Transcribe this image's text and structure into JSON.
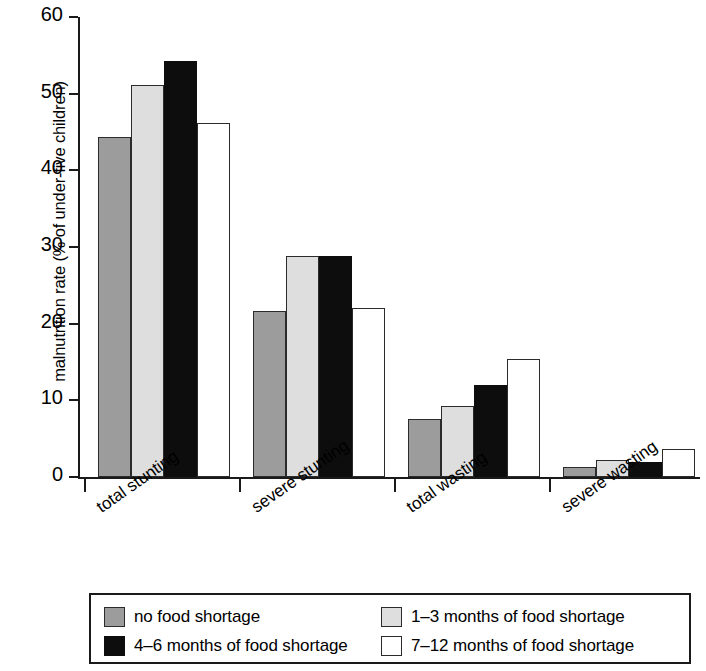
{
  "chart_data": {
    "type": "bar",
    "title": "",
    "xlabel": "",
    "ylabel": "malnutrition rate (% of under-five children)",
    "ylim": [
      0,
      60
    ],
    "yticks": [
      0,
      10,
      20,
      30,
      40,
      50,
      60
    ],
    "ytick_labels": [
      "0",
      "10",
      "20",
      "30",
      "40",
      "50",
      "60"
    ],
    "grid": false,
    "legend_position": "bottom",
    "categories": [
      "total stunting",
      "severe stunting",
      "total wasting",
      "severe wasting"
    ],
    "series": [
      {
        "name": "no food shortage",
        "color": "#9c9c9c",
        "values": [
          44.4,
          21.7,
          7.6,
          1.3
        ]
      },
      {
        "name": "1–3 months of food shortage",
        "color": "#dedede",
        "values": [
          51.1,
          28.8,
          9.3,
          2.2
        ]
      },
      {
        "name": "4–6 months of food shortage",
        "color": "#0d0d0d",
        "values": [
          54.3,
          28.8,
          12.0,
          1.9
        ]
      },
      {
        "name": "7–12 months of food shortage",
        "color": "#ffffff",
        "values": [
          46.2,
          22.0,
          15.4,
          3.7
        ]
      }
    ]
  },
  "legend": {
    "rows": [
      [
        {
          "label": "no food shortage",
          "swatch": "swatch-no-food-shortage"
        },
        {
          "label": "1–3 months of food shortage",
          "swatch": "swatch-1-3-months"
        }
      ],
      [
        {
          "label": "4–6 months of food shortage",
          "swatch": "swatch-4-6-months"
        },
        {
          "label": "7–12 months of food shortage",
          "swatch": "swatch-7-12-months"
        }
      ]
    ]
  }
}
